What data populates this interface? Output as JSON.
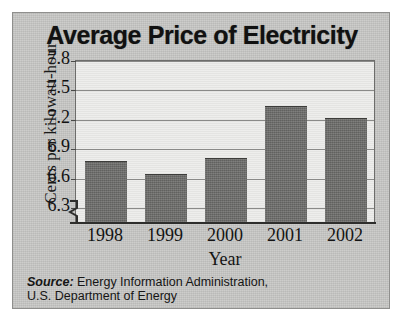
{
  "chart_data": {
    "type": "bar",
    "title": "Average Price of Electricity",
    "xlabel": "Year",
    "ylabel": "Cents per kilowatt-hour",
    "categories": [
      "1998",
      "1999",
      "2000",
      "2001",
      "2002"
    ],
    "values": [
      6.77,
      6.64,
      6.8,
      7.33,
      7.21
    ],
    "ylim": [
      6.15,
      7.8
    ],
    "yticks": [
      "7.8",
      "7.5",
      "7.2",
      "6.9",
      "6.6",
      "6.3"
    ],
    "ytick_values": [
      7.8,
      7.5,
      7.2,
      6.9,
      6.6,
      6.3
    ],
    "grid": true,
    "legend": null,
    "axis_break": true,
    "bar_color": "#6e6e6c",
    "plot_background": "#e9e9e7",
    "card_background": "#c9c9c7"
  },
  "source": {
    "prefix": "Source:",
    "line1": " Energy Information Administration,",
    "line2": "U.S. Department of Energy"
  }
}
